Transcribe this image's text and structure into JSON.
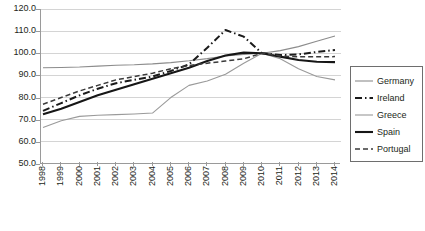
{
  "chart_data": {
    "type": "line",
    "title": "",
    "xlabel": "",
    "ylabel": "",
    "grid": true,
    "legend_position": "right",
    "x": [
      1998,
      1999,
      2000,
      2001,
      2002,
      2003,
      2004,
      2005,
      2006,
      2007,
      2008,
      2009,
      2010,
      2011,
      2012,
      2013,
      2014
    ],
    "categories": [
      "1998",
      "1999",
      "2000",
      "2001",
      "2002",
      "2003",
      "2004",
      "2005",
      "2006",
      "2007",
      "2008",
      "2009",
      "2010",
      "2011",
      "2012",
      "2013",
      "2014"
    ],
    "ylim": [
      50.0,
      120.0
    ],
    "yticks": [
      50.0,
      60.0,
      70.0,
      80.0,
      90.0,
      100.0,
      110.0,
      120.0
    ],
    "ytick_labels": [
      "50.0",
      "60.0",
      "70.0",
      "80.0",
      "90.0",
      "100.0",
      "110.0",
      "120.0"
    ],
    "series": [
      {
        "name": "Germany",
        "style": "solid-thin",
        "color": "#8c8c8c",
        "width": 1.1,
        "values": [
          93.5,
          93.6,
          93.8,
          94.2,
          94.6,
          94.8,
          95.2,
          95.8,
          96.6,
          97.6,
          98.8,
          99.5,
          100.0,
          101.2,
          103.0,
          105.4,
          107.8
        ]
      },
      {
        "name": "Ireland",
        "style": "dash-dot",
        "color": "#1a1a1a",
        "width": 2.0,
        "values": [
          74.0,
          77.5,
          81.0,
          84.0,
          86.5,
          88.0,
          89.5,
          92.0,
          95.0,
          102.5,
          110.5,
          107.5,
          100.0,
          99.2,
          99.5,
          100.6,
          101.5
        ]
      },
      {
        "name": "Greece",
        "style": "solid-thin",
        "color": "#9a9a9a",
        "width": 1.1,
        "values": [
          66.5,
          69.5,
          71.5,
          72.0,
          72.3,
          72.6,
          73.0,
          80.0,
          85.5,
          87.5,
          90.5,
          95.5,
          100.0,
          97.5,
          93.0,
          89.5,
          88.0
        ]
      },
      {
        "name": "Spain",
        "style": "solid-bold",
        "color": "#161616",
        "width": 2.1,
        "values": [
          72.5,
          75.0,
          78.0,
          81.0,
          83.5,
          86.0,
          88.5,
          91.0,
          93.5,
          96.5,
          99.0,
          100.3,
          100.0,
          98.5,
          97.0,
          96.2,
          96.0
        ]
      },
      {
        "name": "Portugal",
        "style": "dashed",
        "color": "#3a3a3a",
        "width": 1.5,
        "values": [
          77.0,
          80.0,
          83.0,
          85.5,
          88.0,
          89.5,
          91.0,
          93.0,
          94.5,
          95.5,
          96.5,
          97.5,
          100.0,
          98.8,
          98.4,
          98.4,
          98.5
        ]
      }
    ]
  },
  "legend": {
    "items": [
      {
        "label": "Germany"
      },
      {
        "label": "Ireland"
      },
      {
        "label": "Greece"
      },
      {
        "label": "Spain"
      },
      {
        "label": "Portugal"
      }
    ]
  }
}
